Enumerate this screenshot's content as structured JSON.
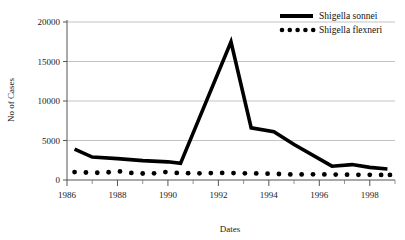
{
  "chart_data": {
    "type": "line",
    "title": "",
    "xlabel": "Dates",
    "ylabel": "No of Cases",
    "xlim": [
      1986,
      1999
    ],
    "ylim": [
      0,
      20000
    ],
    "grid": true,
    "legend_position": "top-right",
    "x_tick_labels": [
      "1986",
      "1988",
      "1990",
      "1992",
      "1994",
      "1996",
      "1998"
    ],
    "x_tick_values": [
      1986,
      1988,
      1990,
      1992,
      1994,
      1996,
      1998
    ],
    "x_minor_ticks": [
      1987,
      1989,
      1991,
      1993,
      1995,
      1997,
      1999
    ],
    "y_tick_labels": [
      "0",
      "5000",
      "10000",
      "15000",
      "20000"
    ],
    "y_tick_values": [
      0,
      5000,
      10000,
      15000,
      20000
    ],
    "series": [
      {
        "name": "Shigella sonnei",
        "style": "solid",
        "color": "#000000",
        "x": [
          1986.3,
          1987.0,
          1988.0,
          1989.0,
          1990.0,
          1990.5,
          1992.5,
          1993.3,
          1994.2,
          1995.0,
          1996.5,
          1997.3,
          1998.0,
          1998.7
        ],
        "values": [
          3900,
          2900,
          2700,
          2450,
          2300,
          2100,
          17500,
          6600,
          6100,
          4500,
          1750,
          1950,
          1600,
          1400
        ]
      },
      {
        "name": "Shigella flexneri",
        "style": "dotted",
        "color": "#000000",
        "x": [
          1986.3,
          1986.75,
          1987.2,
          1987.65,
          1988.1,
          1988.55,
          1989.0,
          1989.45,
          1989.9,
          1990.35,
          1990.8,
          1991.25,
          1991.7,
          1992.15,
          1992.6,
          1993.05,
          1993.5,
          1993.95,
          1994.4,
          1994.85,
          1995.3,
          1995.75,
          1996.2,
          1996.65,
          1997.1,
          1997.55,
          1998.0,
          1998.45,
          1998.8
        ],
        "values": [
          1000,
          950,
          920,
          980,
          1080,
          900,
          820,
          840,
          1000,
          900,
          870,
          850,
          880,
          900,
          880,
          850,
          830,
          800,
          760,
          700,
          700,
          720,
          700,
          690,
          680,
          660,
          650,
          640,
          640
        ]
      }
    ]
  },
  "legend": {
    "entries": [
      {
        "label": "Shigella sonnei"
      },
      {
        "label": "Shigella flexneri"
      }
    ]
  }
}
